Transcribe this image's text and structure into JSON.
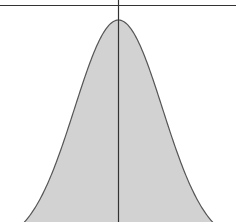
{
  "chart_data": {
    "type": "area",
    "title": "",
    "xlabel": "",
    "ylabel": "",
    "distribution": {
      "mean_px": 118.5,
      "sigma_px": 44,
      "peak_y_px": 20,
      "baseline_y_px": 245
    },
    "grid": false,
    "legend": null
  },
  "colors": {
    "fill": "#d2d2d2",
    "stroke": "#555555",
    "axis": "#333333",
    "background": "#ffffff"
  }
}
